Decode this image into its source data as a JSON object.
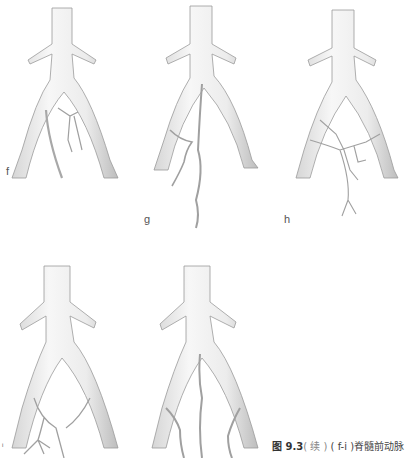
{
  "figure": {
    "panels": [
      {
        "id": "f",
        "label": "f",
        "description": "Aortic bifurcation with anterior spinal artery branches arising from left iliac"
      },
      {
        "id": "g",
        "label": "g",
        "description": "Aortic bifurcation with tortuous artery arising from bifurcation and left iliac"
      },
      {
        "id": "h",
        "label": "h",
        "description": "Aortic bifurcation with branching network from both iliacs"
      },
      {
        "id": "i",
        "label": "i",
        "description": "Aortic bifurcation with arteries from both iliacs joining into a single trunk"
      },
      {
        "id": "j",
        "label": "",
        "description": "Aortic bifurcation with three tortuous arteries"
      }
    ],
    "caption": {
      "fig_number": "图 9.3",
      "continued": "( 续 )",
      "range": "( f-i )",
      "text": "脊髓前动脉"
    }
  },
  "colors": {
    "vessel_fill": "#f2f2f2",
    "vessel_stroke": "#9a9a9a",
    "vessel_shade": "#c8c8c8",
    "background": "#ffffff"
  }
}
